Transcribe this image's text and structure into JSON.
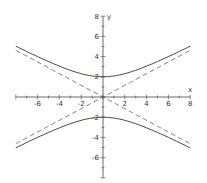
{
  "chart_data": {
    "type": "line",
    "title": "",
    "xlabel": "x",
    "ylabel": "y",
    "xlim": [
      -8,
      8
    ],
    "ylim": [
      -8,
      8
    ],
    "x_ticks": [
      -6,
      -4,
      -2,
      2,
      4,
      6,
      8
    ],
    "y_ticks": [
      8,
      6,
      4,
      2,
      -2,
      -4,
      -6
    ],
    "grid": false,
    "legend": null,
    "series": [
      {
        "name": "hyperbola upper branch",
        "style": "solid",
        "equation": "y^2/4 - x^2/12 = 1, y>0",
        "x": [
          -8,
          -6,
          -4,
          -2,
          0,
          2,
          4,
          6,
          8
        ],
        "y": [
          5.03,
          4.0,
          3.06,
          2.31,
          2.0,
          2.31,
          3.06,
          4.0,
          5.03
        ]
      },
      {
        "name": "hyperbola lower branch",
        "style": "solid",
        "equation": "y^2/4 - x^2/12 = 1, y<0",
        "x": [
          -8,
          -6,
          -4,
          -2,
          0,
          2,
          4,
          6,
          8
        ],
        "y": [
          -5.03,
          -4.0,
          -3.06,
          -2.31,
          -2.0,
          -2.31,
          -3.06,
          -4.0,
          -5.03
        ]
      },
      {
        "name": "asymptote 1",
        "style": "dashed",
        "equation": "y = x/sqrt(3)",
        "x": [
          -8,
          8
        ],
        "y": [
          -4.62,
          4.62
        ]
      },
      {
        "name": "asymptote 2",
        "style": "dashed",
        "equation": "y = -x/sqrt(3)",
        "x": [
          -8,
          8
        ],
        "y": [
          4.62,
          -4.62
        ]
      }
    ]
  },
  "labels": {
    "x_axis": "x",
    "y_axis": "y"
  },
  "ticks": {
    "x": [
      {
        "v": -6,
        "t": "-6"
      },
      {
        "v": -4,
        "t": "-4"
      },
      {
        "v": -2,
        "t": "-2"
      },
      {
        "v": 2,
        "t": "2"
      },
      {
        "v": 4,
        "t": "4"
      },
      {
        "v": 6,
        "t": "6"
      },
      {
        "v": 8,
        "t": "8"
      }
    ],
    "y": [
      {
        "v": 8,
        "t": "8"
      },
      {
        "v": 6,
        "t": "6"
      },
      {
        "v": 4,
        "t": "4"
      },
      {
        "v": 2,
        "t": "2"
      },
      {
        "v": -2,
        "t": "-2"
      },
      {
        "v": -4,
        "t": "-4"
      },
      {
        "v": -6,
        "t": "-6"
      }
    ]
  }
}
